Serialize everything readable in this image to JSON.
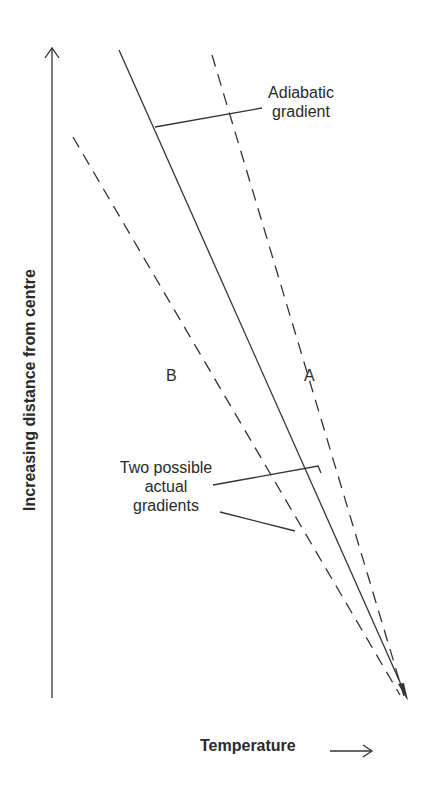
{
  "diagram": {
    "axes": {
      "y_label": "Increasing distance from centre",
      "x_label": "Temperature"
    },
    "labels": {
      "adiabatic_line1": "Adiabatic",
      "adiabatic_line2": "gradient",
      "line_a": "A",
      "line_b": "B",
      "actual_line1": "Two possible",
      "actual_line2": "actual",
      "actual_line3": "gradients"
    },
    "lines": [
      {
        "id": "adiabatic",
        "style": "solid",
        "from": [
          119,
          50
        ],
        "to": [
          408,
          700
        ]
      },
      {
        "id": "A",
        "style": "dashed",
        "from": [
          212,
          55
        ],
        "to": [
          405,
          697
        ]
      },
      {
        "id": "B",
        "style": "dashed",
        "from": [
          73,
          137
        ],
        "to": [
          400,
          695
        ]
      }
    ],
    "colors": {
      "ink": "#2a2a2a",
      "background": "#ffffff"
    }
  }
}
